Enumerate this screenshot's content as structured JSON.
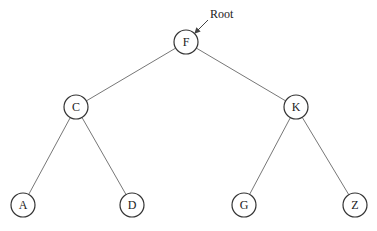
{
  "diagram": {
    "type": "binary-tree",
    "root_annotation": "Root",
    "nodes": [
      {
        "id": "F",
        "label": "F",
        "x": 186,
        "y": 42
      },
      {
        "id": "C",
        "label": "C",
        "x": 76,
        "y": 107
      },
      {
        "id": "K",
        "label": "K",
        "x": 296,
        "y": 107
      },
      {
        "id": "A",
        "label": "A",
        "x": 23,
        "y": 205
      },
      {
        "id": "D",
        "label": "D",
        "x": 132,
        "y": 205
      },
      {
        "id": "G",
        "label": "G",
        "x": 244,
        "y": 205
      },
      {
        "id": "Z",
        "label": "Z",
        "x": 355,
        "y": 205
      }
    ],
    "edges": [
      [
        "F",
        "C"
      ],
      [
        "F",
        "K"
      ],
      [
        "C",
        "A"
      ],
      [
        "C",
        "D"
      ],
      [
        "K",
        "G"
      ],
      [
        "K",
        "Z"
      ]
    ]
  }
}
